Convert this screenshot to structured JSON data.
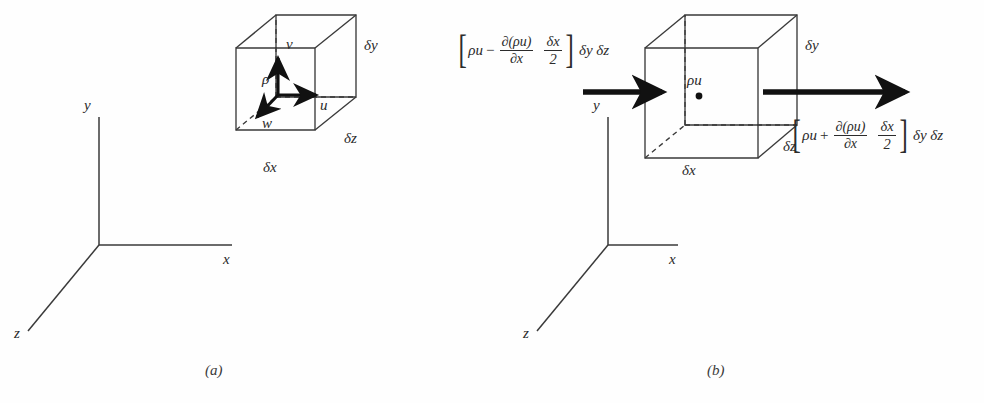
{
  "figure": {
    "colors": {
      "line": "#3a3a3a",
      "text": "#2a2a2a",
      "arrow": "#111111",
      "background": "#ffffff"
    }
  },
  "panel_a": {
    "caption": "(a)",
    "axes": {
      "y_label": "y",
      "x_label": "x",
      "z_label": "z"
    },
    "cube": {
      "dim_x_label": "δx",
      "dim_y_label": "δy",
      "dim_z_label": "δz"
    },
    "vectors": {
      "density_label": "ρ",
      "v_label": "v",
      "u_label": "u",
      "w_label": "w"
    }
  },
  "panel_b": {
    "caption": "(b)",
    "axes": {
      "y_label": "y",
      "x_label": "x",
      "z_label": "z"
    },
    "cube": {
      "dim_x_label": "δx",
      "dim_y_label": "δy",
      "dim_z_label": "δz",
      "center_label": "ρu"
    },
    "inflow": {
      "base_term": "ρu",
      "operator": "−",
      "deriv_numerator": "∂(ρu)",
      "deriv_denominator": "∂x",
      "half_numerator": "δx",
      "half_denominator": "2",
      "area_term": "δy δz"
    },
    "outflow": {
      "base_term": "ρu",
      "operator": "+",
      "deriv_numerator": "∂(ρu)",
      "deriv_denominator": "∂x",
      "half_numerator": "δx",
      "half_denominator": "2",
      "area_term": "δy δz"
    }
  }
}
